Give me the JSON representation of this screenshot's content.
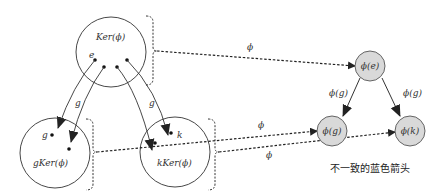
{
  "diagram": {
    "left": {
      "kernel_set": {
        "label": "Ker(ϕ)",
        "elements": {
          "e": "e"
        }
      },
      "coset_g": {
        "label": "gKer(ϕ)",
        "element": "g"
      },
      "coset_k": {
        "label": "kKer(ϕ)",
        "element": "k"
      },
      "arrow_labels": {
        "left_g": "g",
        "right_g": "g"
      }
    },
    "mappings": {
      "top_phi": "ϕ",
      "mid_phi": "ϕ",
      "low_phi": "ϕ"
    },
    "right": {
      "nodes": {
        "phi_e": "ϕ(e)",
        "phi_g": "ϕ(g)",
        "phi_k": "ϕ(k)"
      },
      "edge_labels": {
        "left": "ϕ(g)",
        "right": "ϕ(g)"
      },
      "node_fill": "#d9d9d9",
      "caption": "不一致的蓝色箭头"
    }
  }
}
